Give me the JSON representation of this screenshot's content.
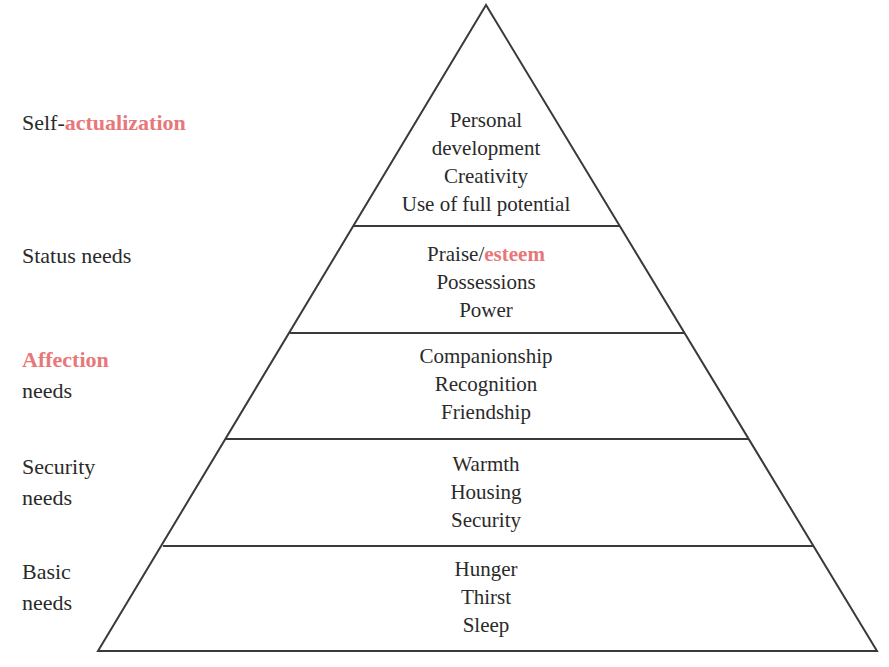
{
  "colors": {
    "text": "#2a2a2a",
    "accent": "#e8777a",
    "line": "#3a3a3a",
    "background": "#ffffff"
  },
  "levels": [
    {
      "label_parts": [
        "Self-",
        "actualization"
      ],
      "label_accent_index": 1,
      "items": [
        "Personal",
        "development",
        "Creativity",
        "Use of full potential"
      ]
    },
    {
      "label_parts": [
        "Status needs"
      ],
      "items_first_parts": [
        "Praise/",
        "esteem"
      ],
      "items": [
        "Possessions",
        "Power"
      ]
    },
    {
      "label_lines": [
        "Affection",
        "needs"
      ],
      "label_accent_line": 0,
      "items": [
        "Companionship",
        "Recognition",
        "Friendship"
      ]
    },
    {
      "label_lines": [
        "Security",
        "needs"
      ],
      "items": [
        "Warmth",
        "Housing",
        "Security"
      ]
    },
    {
      "label_lines": [
        "Basic",
        "needs"
      ],
      "items": [
        "Hunger",
        "Thirst",
        "Sleep"
      ]
    }
  ],
  "geometry": {
    "apex": [
      486,
      5
    ],
    "dividers": [
      {
        "y": 226,
        "x1": 353,
        "x2": 620
      },
      {
        "y": 333,
        "x1": 290,
        "x2": 684
      },
      {
        "y": 439,
        "x1": 226,
        "x2": 748
      },
      {
        "y": 546,
        "x1": 163,
        "x2": 813
      }
    ],
    "base": {
      "y": 651,
      "x1": 98,
      "x2": 877
    }
  }
}
